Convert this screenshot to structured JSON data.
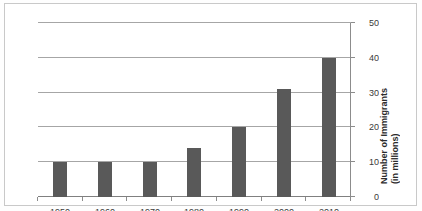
{
  "chart_data": {
    "type": "bar",
    "title": "",
    "subtitle": "",
    "xlabel": "",
    "ylabel": "Number of Immigrants (in millions)",
    "ylabel_line1": "Number of Immigrants",
    "ylabel_line2": "(in millions)",
    "categories": [
      "2010",
      "2000",
      "1990",
      "1980",
      "1970",
      "1960",
      "1950"
    ],
    "values": [
      40,
      31,
      20,
      14,
      10,
      10,
      10
    ],
    "series": [
      {
        "name": "Number of Immigrants",
        "values": [
          40,
          31,
          20,
          14,
          10,
          10,
          10
        ]
      }
    ],
    "ylim": [
      0,
      50
    ],
    "ytick_labels": [
      "0",
      "10",
      "20",
      "30",
      "40",
      "50"
    ],
    "ytick_values": [
      0,
      10,
      20,
      30,
      40,
      50
    ],
    "grid": true,
    "legend": "none",
    "orientation": "rotated-180",
    "bar_color": "#595959",
    "gridline_color": "#a6a6a6",
    "axis_color": "#8c8c8c",
    "background_color": "#ffffff",
    "border_color": "#c9c9c9",
    "note": "Chart image is rotated 180 degrees; value axis appears on the right side of the page."
  }
}
